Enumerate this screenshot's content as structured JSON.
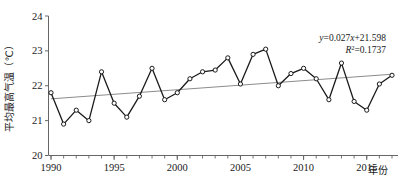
{
  "chart_data": {
    "type": "line",
    "title": "",
    "subtitle": "",
    "xlabel": "年份",
    "ylabel": "平均最高气温（℃）",
    "xlim": [
      1990,
      2017
    ],
    "ylim": [
      20,
      24
    ],
    "ytick_labels": [
      "20",
      "21",
      "22",
      "23",
      "24"
    ],
    "yticks": [
      20,
      21,
      22,
      23,
      24
    ],
    "xtick_labels": [
      "1990",
      "1995",
      "2000",
      "2005",
      "2010",
      "2015"
    ],
    "xticks": [
      1990,
      1995,
      2000,
      2005,
      2010,
      2015
    ],
    "minor_xticks_every": 1,
    "grid": false,
    "legend": "none",
    "marker": "open-circle",
    "x": [
      1990,
      1991,
      1992,
      1993,
      1994,
      1995,
      1996,
      1997,
      1998,
      1999,
      2000,
      2001,
      2002,
      2003,
      2004,
      2005,
      2006,
      2007,
      2008,
      2009,
      2010,
      2011,
      2012,
      2013,
      2014,
      2015,
      2016,
      2017
    ],
    "values": [
      21.8,
      20.9,
      21.3,
      21.0,
      22.4,
      21.5,
      21.1,
      21.7,
      22.5,
      21.6,
      21.8,
      22.2,
      22.4,
      22.45,
      22.8,
      22.05,
      22.9,
      23.05,
      22.0,
      22.35,
      22.5,
      22.2,
      21.6,
      22.65,
      21.55,
      21.3,
      22.05,
      22.3
    ],
    "series": [
      {
        "name": "平均最高气温",
        "values": [
          21.8,
          20.9,
          21.3,
          21.0,
          22.4,
          21.5,
          21.1,
          21.7,
          22.5,
          21.6,
          21.8,
          22.2,
          22.4,
          22.45,
          22.8,
          22.05,
          22.9,
          23.05,
          22.0,
          22.35,
          22.5,
          22.2,
          21.6,
          22.65,
          21.55,
          21.3,
          22.05,
          22.3
        ],
        "color": "#1a1a1a"
      }
    ],
    "trendline": {
      "slope": 0.027,
      "intercept": 21.598,
      "r_squared": 0.1737,
      "color": "#8c8c8c",
      "y_start": 21.625,
      "y_end": 22.33
    },
    "annotations": [
      {
        "name": "regression-equation",
        "text": "y=0.027x+21.598"
      },
      {
        "name": "r-squared",
        "text": "R2=0.1737"
      }
    ]
  },
  "annotation": {
    "equation_y": "y",
    "equation_rest": "=0.027",
    "equation_x": "x",
    "equation_tail": "+21.598",
    "r_symbol": "R",
    "r_exp": "2",
    "r_value": "=0.1737"
  },
  "axes": {
    "y_label": "平均最高气温（℃）",
    "x_label": "年份"
  }
}
